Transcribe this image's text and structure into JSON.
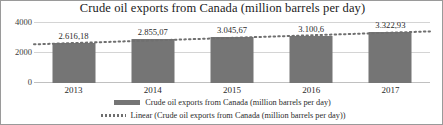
{
  "chart_data": {
    "type": "bar",
    "title": "Crude oil exports from Canada (million barrels per day)",
    "xlabel": "",
    "ylabel": "",
    "categories": [
      "2013",
      "2014",
      "2015",
      "2016",
      "2017"
    ],
    "values": [
      2616.18,
      2855.07,
      3045.67,
      3100.6,
      3322.93
    ],
    "data_labels": [
      "2.616,18",
      "2.855,07",
      "3.045,67",
      "3.100,6",
      "3.322,93"
    ],
    "ylim": [
      0,
      4000
    ],
    "y_ticks": [
      "0",
      "2000",
      "4000"
    ],
    "grid": true,
    "legend_position": "bottom",
    "series": [
      {
        "name": "Crude oil exports from Canada (million barrels per day)",
        "type": "bar",
        "color": "#757575",
        "values": [
          2616.18,
          2855.07,
          3045.67,
          3100.6,
          3322.93
        ]
      },
      {
        "name": "Linear (Crude oil exports from Canada (million barrels per day))",
        "type": "line",
        "style": "dotted",
        "color": "#6f6f6f",
        "values": [
          2620.0,
          2790.0,
          2960.0,
          3130.0,
          3300.0
        ]
      }
    ],
    "legend": [
      {
        "marker": "bar-swatch",
        "label": "Crude oil exports from Canada (million barrels per day)"
      },
      {
        "marker": "dotted-line-swatch",
        "label": "Linear (Crude oil exports from Canada (million barrels per day))"
      }
    ]
  },
  "colors": {
    "bar": "#757575",
    "trendline": "#6f6f6f",
    "gridline": "#d4d4d4",
    "border": "#9a9a9a",
    "text": "#2b2b2b"
  }
}
